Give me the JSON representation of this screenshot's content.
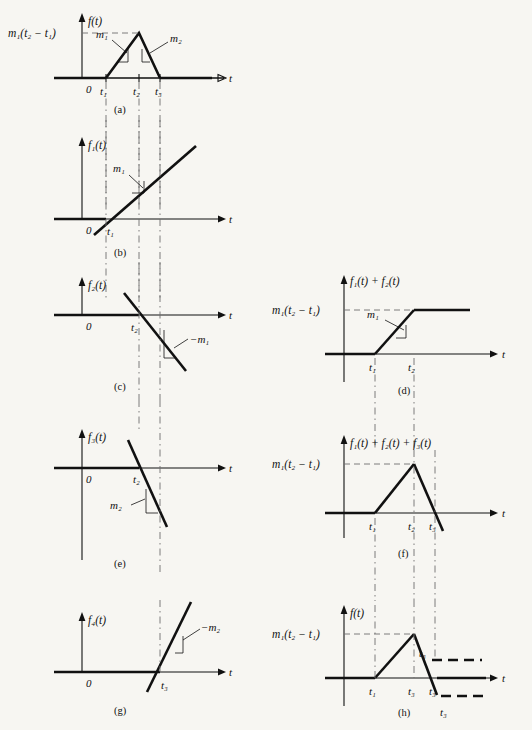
{
  "figure": {
    "background_color": "#f7f6f2",
    "ink_color": "#111111",
    "guide_color": "#6e6e6e",
    "axis_time_label": "t",
    "origin_label": "0"
  },
  "symbols": {
    "peak_value": "m₁(t₂ − t₁)",
    "slope_m1": "m₁",
    "slope_m2": "m₂",
    "slope_neg_m1": "−m₁",
    "slope_neg_m2": "−m₂",
    "t1": "t₁",
    "t2": "t₂",
    "t3": "t₃"
  },
  "panels": [
    {
      "id": "a",
      "caption": "(a)",
      "y_axis_label": "f(t)",
      "y_value_label": "m₁(t₂ − t₁)",
      "x_ticks": [
        "t₁",
        "t₂",
        "t₃"
      ],
      "slope_labels": [
        "m₁",
        "m₂"
      ],
      "description": "Trapezoidal/triangular pulse rising from t1 with slope m1 to peak at t2, falling with slope m2 to zero at t3"
    },
    {
      "id": "b",
      "caption": "(b)",
      "y_axis_label": "f₁(t)",
      "x_ticks": [
        "t₁"
      ],
      "slope_labels": [
        "m₁"
      ],
      "description": "Ramp function crossing zero at t1 with positive slope m1"
    },
    {
      "id": "c",
      "caption": "(c)",
      "y_axis_label": "f₂(t)",
      "x_ticks": [
        "t₂"
      ],
      "slope_labels": [
        "−m₁"
      ],
      "description": "Ramp function crossing zero at t2 with negative slope minus m1"
    },
    {
      "id": "e",
      "caption": "(e)",
      "y_axis_label": "f₃(t)",
      "x_ticks": [
        "t₂"
      ],
      "slope_labels": [
        "m₂"
      ],
      "description": "Ramp function crossing zero at t2 with negative slope m2"
    },
    {
      "id": "g",
      "caption": "(g)",
      "y_axis_label": "f₄(t)",
      "x_ticks": [
        "t₃"
      ],
      "slope_labels": [
        "−m₂"
      ],
      "description": "Ramp function crossing zero at t3 with positive slope minus m2"
    },
    {
      "id": "d",
      "caption": "(d)",
      "y_axis_label": "f₁(t) + f₂(t)",
      "y_value_label": "m₁(t₂ − t₁)",
      "x_ticks": [
        "t₁",
        "t₂"
      ],
      "slope_labels": [
        "m₁"
      ],
      "description": "Sum of f1 and f2: zero until t1, ramps with slope m1, saturates at m1(t2-t1) after t2"
    },
    {
      "id": "f",
      "caption": "(f)",
      "y_axis_label": "f₁(t) + f₂(t) + f₃(t)",
      "y_value_label": "m₁(t₂ − t₁)",
      "x_ticks": [
        "t₁",
        "t₂",
        "t₃"
      ],
      "description": "Sum of three ramps: rises to peak at t2 then falls through zero at t3 and continues negative"
    },
    {
      "id": "h",
      "caption": "(h)",
      "y_axis_label": "f(t)",
      "y_value_label": "m₁(t₂ − t₁)",
      "x_ticks": [
        "t₁",
        "t₃",
        "t₃"
      ],
      "extra_labels": [
        "t₃",
        "t₃"
      ],
      "description": "Final reconstructed pulse with cancelling dashed asymptote lines after t3"
    }
  ]
}
